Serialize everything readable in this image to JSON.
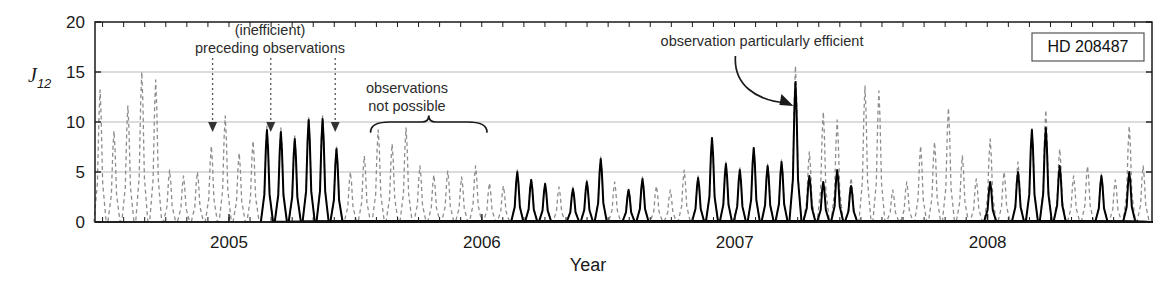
{
  "figure": {
    "legend_box_label": "HD 208487",
    "colors": {
      "axis": "#1a1a1a",
      "grid": "#b9b9b9",
      "dashed_series": "#8d8d8d",
      "solid_series": "#000000",
      "annotation": "#2b2b2b"
    }
  },
  "annotations": [
    {
      "id": "inefficient-preceding",
      "line1": "(inefficient)",
      "line2": "preceding observations"
    },
    {
      "id": "not-possible",
      "line1": "observations",
      "line2": "not possible"
    },
    {
      "id": "particularly-efficient",
      "line1": "observation particularly efficient"
    }
  ],
  "chart_data": {
    "type": "line",
    "title": "",
    "xlabel": "Year",
    "ylabel": "J12",
    "ylim": [
      0,
      20
    ],
    "xlim": [
      2004.47,
      2008.65
    ],
    "yticks": [
      0,
      5,
      10,
      15,
      20
    ],
    "ytick_labels": [
      "0",
      "5",
      "10",
      "15",
      "20"
    ],
    "xticks": [
      2005,
      2006,
      2007,
      2008
    ],
    "xtick_labels": [
      "2005",
      "2006",
      "2007",
      "2008"
    ],
    "grid": "horizontal",
    "gridlines_y": [
      5,
      10,
      15
    ],
    "legend_position": "top-right",
    "minor_tick_interval_years": 0.0833,
    "series": [
      {
        "name": "J12 full (unobserved / inefficient)",
        "style": "dashed",
        "color": "#8d8d8d",
        "description": "Periodic J12 merit function sampled densely across 2004.47-2008.65"
      },
      {
        "name": "J12 observed (efficient nights)",
        "style": "solid",
        "color": "#000000",
        "description": "Subset of nights where observations were actually scheduled"
      }
    ],
    "peaks_dashed": [
      {
        "x": 2004.49,
        "y": 13.2
      },
      {
        "x": 2004.545,
        "y": 9.1
      },
      {
        "x": 2004.6,
        "y": 11.6
      },
      {
        "x": 2004.655,
        "y": 15.0
      },
      {
        "x": 2004.71,
        "y": 14.2
      },
      {
        "x": 2004.765,
        "y": 5.2
      },
      {
        "x": 2004.82,
        "y": 4.6
      },
      {
        "x": 2004.875,
        "y": 5.0
      },
      {
        "x": 2004.93,
        "y": 7.6
      },
      {
        "x": 2004.985,
        "y": 10.6
      },
      {
        "x": 2005.04,
        "y": 6.9
      },
      {
        "x": 2005.095,
        "y": 8.1
      },
      {
        "x": 2005.15,
        "y": 9.6
      },
      {
        "x": 2005.205,
        "y": 9.4
      },
      {
        "x": 2005.26,
        "y": 8.6
      },
      {
        "x": 2005.315,
        "y": 10.5
      },
      {
        "x": 2005.37,
        "y": 10.6
      },
      {
        "x": 2005.425,
        "y": 7.6
      },
      {
        "x": 2005.48,
        "y": 5.0
      },
      {
        "x": 2005.535,
        "y": 6.6
      },
      {
        "x": 2005.59,
        "y": 9.2
      },
      {
        "x": 2005.645,
        "y": 7.8
      },
      {
        "x": 2005.7,
        "y": 9.4
      },
      {
        "x": 2005.755,
        "y": 5.6
      },
      {
        "x": 2005.81,
        "y": 4.7
      },
      {
        "x": 2005.865,
        "y": 5.1
      },
      {
        "x": 2005.92,
        "y": 4.5
      },
      {
        "x": 2005.975,
        "y": 5.6
      },
      {
        "x": 2006.03,
        "y": 3.9
      },
      {
        "x": 2006.085,
        "y": 3.6
      },
      {
        "x": 2006.14,
        "y": 5.2
      },
      {
        "x": 2006.195,
        "y": 4.4
      },
      {
        "x": 2006.25,
        "y": 4.0
      },
      {
        "x": 2006.305,
        "y": 3.5
      },
      {
        "x": 2006.36,
        "y": 3.5
      },
      {
        "x": 2006.415,
        "y": 4.2
      },
      {
        "x": 2006.47,
        "y": 6.5
      },
      {
        "x": 2006.525,
        "y": 4.0
      },
      {
        "x": 2006.58,
        "y": 3.4
      },
      {
        "x": 2006.635,
        "y": 4.5
      },
      {
        "x": 2006.69,
        "y": 3.6
      },
      {
        "x": 2006.745,
        "y": 3.2
      },
      {
        "x": 2006.8,
        "y": 5.2
      },
      {
        "x": 2006.855,
        "y": 4.6
      },
      {
        "x": 2006.91,
        "y": 8.6
      },
      {
        "x": 2006.965,
        "y": 6.0
      },
      {
        "x": 2007.02,
        "y": 5.4
      },
      {
        "x": 2007.075,
        "y": 7.6
      },
      {
        "x": 2007.13,
        "y": 5.8
      },
      {
        "x": 2007.185,
        "y": 6.2
      },
      {
        "x": 2007.24,
        "y": 15.6
      },
      {
        "x": 2007.295,
        "y": 7.0
      },
      {
        "x": 2007.35,
        "y": 11.0
      },
      {
        "x": 2007.405,
        "y": 10.2
      },
      {
        "x": 2007.46,
        "y": 4.4
      },
      {
        "x": 2007.515,
        "y": 13.6
      },
      {
        "x": 2007.57,
        "y": 13.1
      },
      {
        "x": 2007.625,
        "y": 3.2
      },
      {
        "x": 2007.68,
        "y": 4.0
      },
      {
        "x": 2007.735,
        "y": 7.6
      },
      {
        "x": 2007.79,
        "y": 8.0
      },
      {
        "x": 2007.845,
        "y": 11.4
      },
      {
        "x": 2007.9,
        "y": 6.6
      },
      {
        "x": 2007.955,
        "y": 4.3
      },
      {
        "x": 2008.01,
        "y": 8.3
      },
      {
        "x": 2008.065,
        "y": 5.0
      },
      {
        "x": 2008.12,
        "y": 6.0
      },
      {
        "x": 2008.175,
        "y": 9.4
      },
      {
        "x": 2008.23,
        "y": 11.2
      },
      {
        "x": 2008.285,
        "y": 7.3
      },
      {
        "x": 2008.34,
        "y": 4.6
      },
      {
        "x": 2008.395,
        "y": 5.6
      },
      {
        "x": 2008.45,
        "y": 4.8
      },
      {
        "x": 2008.505,
        "y": 4.2
      },
      {
        "x": 2008.56,
        "y": 9.6
      },
      {
        "x": 2008.615,
        "y": 5.6
      }
    ],
    "peaks_solid": [
      {
        "x": 2005.15,
        "y": 9.2
      },
      {
        "x": 2005.205,
        "y": 9.0
      },
      {
        "x": 2005.26,
        "y": 8.3
      },
      {
        "x": 2005.315,
        "y": 10.2
      },
      {
        "x": 2005.37,
        "y": 10.3
      },
      {
        "x": 2005.425,
        "y": 7.3
      },
      {
        "x": 2006.14,
        "y": 5.0
      },
      {
        "x": 2006.195,
        "y": 4.2
      },
      {
        "x": 2006.25,
        "y": 3.8
      },
      {
        "x": 2006.36,
        "y": 3.3
      },
      {
        "x": 2006.415,
        "y": 4.0
      },
      {
        "x": 2006.47,
        "y": 6.3
      },
      {
        "x": 2006.58,
        "y": 3.2
      },
      {
        "x": 2006.635,
        "y": 4.3
      },
      {
        "x": 2006.855,
        "y": 4.4
      },
      {
        "x": 2006.91,
        "y": 8.4
      },
      {
        "x": 2006.965,
        "y": 5.8
      },
      {
        "x": 2007.02,
        "y": 5.2
      },
      {
        "x": 2007.075,
        "y": 7.4
      },
      {
        "x": 2007.13,
        "y": 5.6
      },
      {
        "x": 2007.185,
        "y": 6.0
      },
      {
        "x": 2007.24,
        "y": 14.0
      },
      {
        "x": 2007.295,
        "y": 4.6
      },
      {
        "x": 2007.35,
        "y": 4.0
      },
      {
        "x": 2007.405,
        "y": 5.2
      },
      {
        "x": 2007.46,
        "y": 3.6
      },
      {
        "x": 2008.01,
        "y": 4.0
      },
      {
        "x": 2008.12,
        "y": 5.0
      },
      {
        "x": 2008.175,
        "y": 9.2
      },
      {
        "x": 2008.23,
        "y": 9.4
      },
      {
        "x": 2008.285,
        "y": 5.6
      },
      {
        "x": 2008.45,
        "y": 4.6
      },
      {
        "x": 2008.56,
        "y": 5.0
      }
    ],
    "arrow_markers_x": [
      2004.935,
      2005.165,
      2005.42
    ],
    "brace_span_x": [
      2005.56,
      2006.02
    ],
    "efficient_arrow_target_x": 2007.24
  }
}
